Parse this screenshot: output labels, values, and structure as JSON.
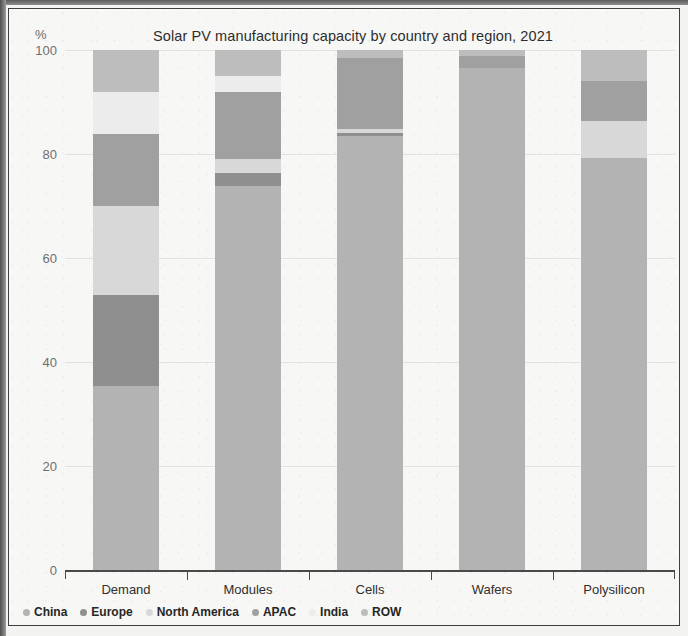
{
  "title": "Solar PV manufacturing capacity by country and region, 2021",
  "axis_unit": "%",
  "legend": [
    {
      "label": "China",
      "color": "#b3b3b3"
    },
    {
      "label": "Europe",
      "color": "#8f8f8f"
    },
    {
      "label": "North America",
      "color": "#d8d8d8"
    },
    {
      "label": "APAC",
      "color": "#a0a0a0"
    },
    {
      "label": "India",
      "color": "#ececec"
    },
    {
      "label": "ROW",
      "color": "#bdbdbd"
    }
  ],
  "chart_data": {
    "type": "bar",
    "subtype": "stacked-100-percent",
    "title": "Solar PV manufacturing capacity by country and region, 2021",
    "xlabel": "",
    "ylabel": "%",
    "ylim": [
      0,
      100
    ],
    "yticks": [
      0,
      20,
      40,
      60,
      80,
      100
    ],
    "grid": true,
    "legend_position": "bottom-left",
    "categories": [
      "Demand",
      "Modules",
      "Cells",
      "Wafers",
      "Polysilicon"
    ],
    "series": [
      {
        "name": "China",
        "color": "#b3b3b3",
        "values": [
          35.4,
          73.8,
          83.5,
          96.5,
          79.2
        ]
      },
      {
        "name": "Europe",
        "color": "#8f8f8f",
        "values": [
          17.5,
          2.5,
          0.6,
          0.0,
          0.0
        ]
      },
      {
        "name": "North America",
        "color": "#d8d8d8",
        "values": [
          17.1,
          2.7,
          0.7,
          0.0,
          7.1
        ]
      },
      {
        "name": "APAC",
        "color": "#a0a0a0",
        "values": [
          13.9,
          13.0,
          13.7,
          2.3,
          7.7
        ]
      },
      {
        "name": "India",
        "color": "#ececec",
        "values": [
          8.1,
          3.0,
          0.0,
          0.0,
          0.0
        ]
      },
      {
        "name": "ROW",
        "color": "#bdbdbd",
        "values": [
          8.0,
          5.0,
          1.5,
          1.2,
          6.0
        ]
      }
    ]
  }
}
